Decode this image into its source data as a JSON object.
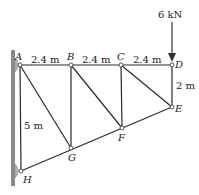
{
  "diagram": {
    "type": "truss",
    "load": {
      "label": "6 kN",
      "node": "D",
      "direction": "down"
    },
    "nodes": {
      "A": {
        "label": "A",
        "x": 20,
        "y": 65
      },
      "B": {
        "label": "B",
        "x": 71,
        "y": 65
      },
      "C": {
        "label": "C",
        "x": 121,
        "y": 65
      },
      "D": {
        "label": "D",
        "x": 172,
        "y": 65
      },
      "E": {
        "label": "E",
        "x": 172,
        "y": 107
      },
      "F": {
        "label": "F",
        "x": 122,
        "y": 128
      },
      "G": {
        "label": "G",
        "x": 71,
        "y": 148
      },
      "H": {
        "label": "H",
        "x": 21,
        "y": 171
      }
    },
    "dimensions": {
      "AB": "2.4 m",
      "BC": "2.4 m",
      "CD": "2.4 m",
      "DE": "2 m",
      "AH": "5 m"
    },
    "supports": [
      "A",
      "H"
    ]
  }
}
